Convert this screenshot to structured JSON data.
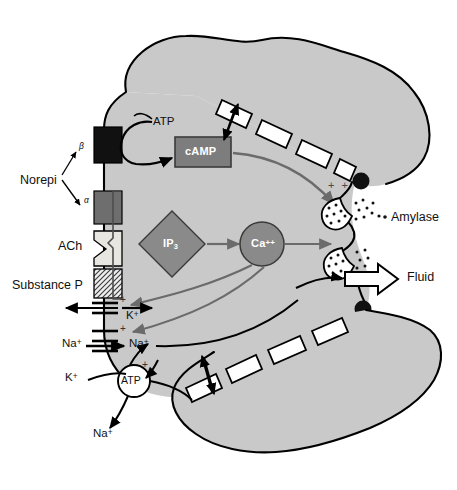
{
  "figure": {
    "type": "cell-signalling-diagram",
    "canvas": {
      "width": 457,
      "height": 490
    }
  },
  "colors": {
    "cytoplasm": "#c9c9c9",
    "outline": "#000000",
    "receptor_beta": "#111111",
    "receptor_alpha": "#6e6e6e",
    "receptor_ach": "#e8e6e1",
    "receptor_substance_p": "#d9d9d9",
    "camp_box": "#7d7d7d",
    "ip3_diamond": "#8a8a8a",
    "calcium_circle": "#8a8a8a",
    "vesicle": "#ffffff",
    "granule": "#111111",
    "arrow_gray": "#6b6b6b",
    "arrow_black": "#000000",
    "background": "#ffffff"
  },
  "ligands": [
    {
      "id": "norepi",
      "label": "Norepi",
      "x": 20,
      "y": 174
    },
    {
      "id": "ach",
      "label": "ACh",
      "x": 58,
      "y": 240
    },
    {
      "id": "substance-p",
      "label": "Substance P",
      "x": 12,
      "y": 279
    }
  ],
  "receptor_subtypes": [
    {
      "id": "beta",
      "label": "β",
      "x": 79,
      "y": 142
    },
    {
      "id": "alpha",
      "label": "α",
      "x": 84,
      "y": 196
    }
  ],
  "receptors": [
    {
      "id": "beta",
      "fill": "#111111",
      "label": "beta-adrenergic receptor"
    },
    {
      "id": "alpha",
      "fill": "#6e6e6e",
      "label": "alpha-adrenergic receptor"
    },
    {
      "id": "ach",
      "fill": "#e8e6e1",
      "label": "muscarinic ACh receptor"
    },
    {
      "id": "substance-p",
      "fill": "#d9d9d9",
      "label": "substance P receptor"
    }
  ],
  "messengers": [
    {
      "id": "atp-cyclase",
      "label": "ATP",
      "x": 153,
      "y": 116,
      "shape": "text"
    },
    {
      "id": "camp",
      "label": "cAMP",
      "x": 182,
      "y": 148,
      "shape": "rect"
    },
    {
      "id": "ip3",
      "label": "IP",
      "sub": "3",
      "x": 162,
      "y": 238,
      "shape": "diamond"
    },
    {
      "id": "calcium",
      "label": "Ca",
      "sup": "++",
      "x": 250,
      "y": 238,
      "shape": "circle"
    },
    {
      "id": "atp-pump",
      "label": "ATP",
      "x": 122,
      "y": 380,
      "shape": "circle"
    }
  ],
  "products": [
    {
      "id": "amylase",
      "label": "Amylase",
      "x": 391,
      "y": 217
    },
    {
      "id": "fluid",
      "label": "Fluid",
      "x": 407,
      "y": 277
    }
  ],
  "ions": [
    {
      "id": "k-out",
      "label": "K",
      "sup": "+",
      "x": 65,
      "y": 378
    },
    {
      "id": "k-chan",
      "label": "K",
      "sup": "+",
      "x": 126,
      "y": 316
    },
    {
      "id": "na-out",
      "label": "Na",
      "sup": "+",
      "x": 62,
      "y": 342
    },
    {
      "id": "na-in",
      "label": "Na",
      "sup": "+",
      "x": 129,
      "y": 345
    },
    {
      "id": "na-pumped",
      "label": "Na",
      "sup": "+",
      "x": 93,
      "y": 430
    }
  ],
  "charge_markers": [
    {
      "id": "exocytosis-plus",
      "label": "+ +",
      "x": 328,
      "y": 184
    },
    {
      "id": "k-channel-plus",
      "label": "+",
      "x": 120,
      "y": 302
    },
    {
      "id": "na-channel-plus",
      "label": "+",
      "x": 120,
      "y": 330
    },
    {
      "id": "pump-plus",
      "label": "+",
      "x": 142,
      "y": 366
    }
  ],
  "structures": [
    {
      "id": "tight-junction-top",
      "label": "tight junction granule"
    },
    {
      "id": "tight-junction-bottom",
      "label": "tight junction granule"
    },
    {
      "id": "canaliculus-top",
      "label": "intercellular canaliculus"
    },
    {
      "id": "canaliculus-bottom",
      "label": "intercellular canaliculus"
    },
    {
      "id": "receptor-bracket",
      "label": "receptor coupling bracket"
    }
  ]
}
